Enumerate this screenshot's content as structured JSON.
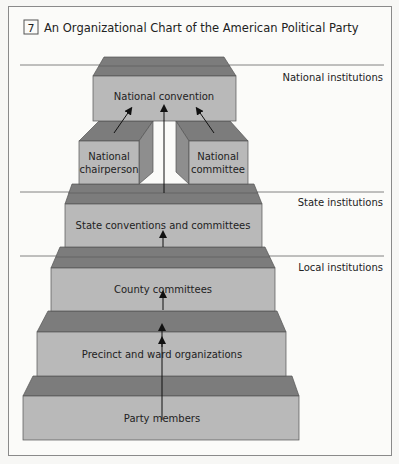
{
  "figure": {
    "number": "7",
    "title": "An Organizational Chart of the American Political Party"
  },
  "levels": {
    "national": "National institutions",
    "state": "State institutions",
    "local": "Local institutions"
  },
  "boxes": {
    "national_convention": "National convention",
    "chair_line1": "National",
    "chair_line2": "chairperson",
    "committee_line1": "National",
    "committee_line2": "committee",
    "state": "State conventions and committees",
    "county": "County committees",
    "precinct": "Precinct and ward organizations",
    "members": "Party members"
  },
  "colors": {
    "front": "#b9b9b9",
    "top": "#7c7c7c",
    "side": "#8e8e8e",
    "edge": "#555555",
    "background": "#fbfbf9"
  }
}
